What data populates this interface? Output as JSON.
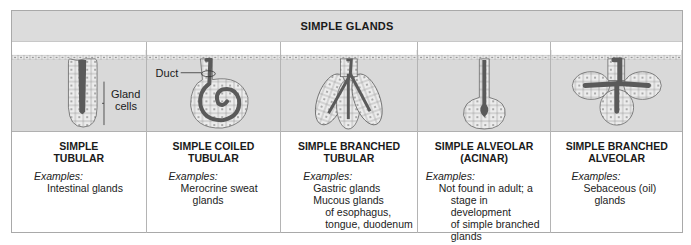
{
  "header": {
    "title": "SIMPLE GLANDS"
  },
  "colors": {
    "header_bg": "#dcdcdc",
    "illustration_bg": "#d9d9d9",
    "border": "#a9a9a9",
    "lumen": "#5a5a5a",
    "cell_fill": "#ececec"
  },
  "columns": [
    {
      "title_line1": "SIMPLE",
      "title_line2": "TUBULAR",
      "examples_label": "Examples:",
      "examples": [
        {
          "text": "Intestinal glands",
          "indent": 1
        }
      ],
      "illustration": "simple-tubular",
      "annotations": {
        "gland_cells_line1": "Gland",
        "gland_cells_line2": "cells"
      }
    },
    {
      "title_line1": "SIMPLE COILED",
      "title_line2": "TUBULAR",
      "examples_label": "Examples:",
      "examples": [
        {
          "text": "Merocrine sweat",
          "indent": 1
        },
        {
          "text": "glands",
          "indent": 2
        }
      ],
      "illustration": "simple-coiled-tubular",
      "annotations": {
        "duct": "Duct"
      }
    },
    {
      "title_line1": "SIMPLE BRANCHED",
      "title_line2": "TUBULAR",
      "examples_label": "Examples:",
      "examples": [
        {
          "text": "Gastric glands",
          "indent": 1
        },
        {
          "text": "Mucous glands",
          "indent": 1
        },
        {
          "text": "of esophagus,",
          "indent": 2
        },
        {
          "text": "tongue, duodenum",
          "indent": 2
        }
      ],
      "illustration": "simple-branched-tubular"
    },
    {
      "title_line1": "SIMPLE ALVEOLAR",
      "title_line2": "(ACINAR)",
      "examples_label": "Examples:",
      "examples": [
        {
          "text": "Not found in adult; a",
          "indent": 1
        },
        {
          "text": "stage in development",
          "indent": 2
        },
        {
          "text": "of simple branched",
          "indent": 2
        },
        {
          "text": "glands",
          "indent": 2
        }
      ],
      "illustration": "simple-alveolar"
    },
    {
      "title_line1": "SIMPLE BRANCHED",
      "title_line2": "ALVEOLAR",
      "examples_label": "Examples:",
      "examples": [
        {
          "text": "Sebaceous (oil)",
          "indent": 1
        },
        {
          "text": "glands",
          "indent": 2
        }
      ],
      "illustration": "simple-branched-alveolar"
    }
  ]
}
